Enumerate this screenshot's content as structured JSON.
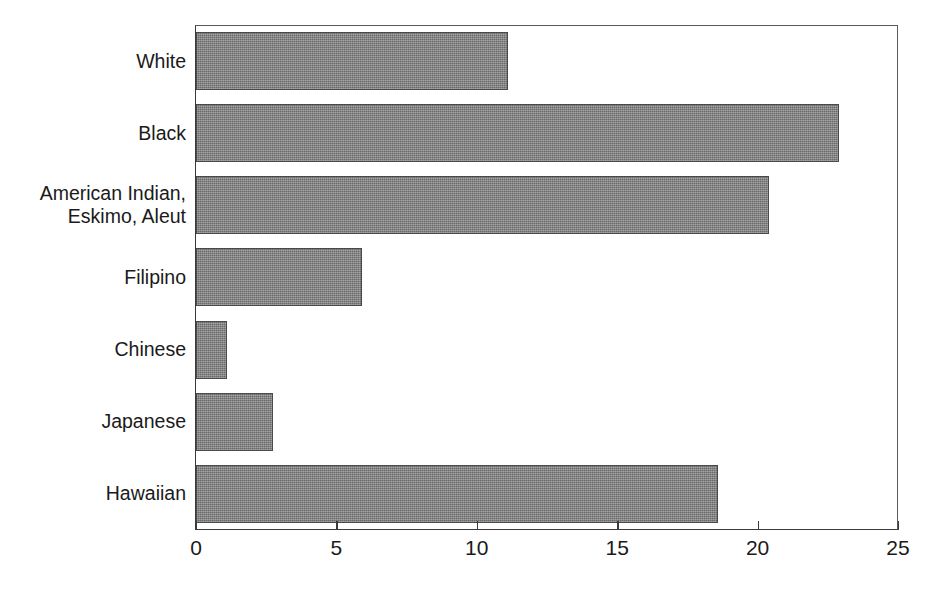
{
  "chart_data": {
    "type": "bar",
    "orientation": "horizontal",
    "title": "",
    "subtitle": "",
    "xlabel": "",
    "ylabel": "",
    "categories": [
      "White",
      "Black",
      "American Indian,\nEskimo, Aleut",
      "Filipino",
      "Chinese",
      "Japanese",
      "Hawaiian"
    ],
    "values": [
      11.1,
      22.9,
      20.4,
      5.9,
      1.1,
      2.75,
      18.6
    ],
    "xlim": [
      0,
      25
    ],
    "xticks": [
      0,
      5,
      10,
      15,
      20,
      25
    ],
    "xticklabels": [
      "0",
      "5",
      "10",
      "15",
      "20",
      "25"
    ],
    "grid": false,
    "legend": false,
    "legend_position": "none",
    "bar_color": "#808080",
    "bar_edge_color": "#4a4a4a",
    "axis_color": "#3a3a3a",
    "background_color": "#ffffff"
  }
}
